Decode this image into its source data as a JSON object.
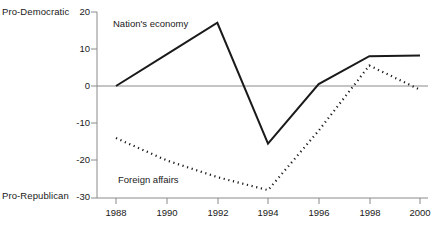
{
  "chart_data": {
    "type": "line",
    "title": "",
    "xlabel": "",
    "ylabel": "",
    "x": [
      1988,
      1990,
      1992,
      1994,
      1996,
      1998,
      2000
    ],
    "xtick_labels": [
      "1988",
      "1990",
      "1992",
      "1994",
      "1996",
      "1998",
      "2000"
    ],
    "ytick_labels": [
      "20",
      "10",
      "0",
      "-10",
      "-20",
      "-30"
    ],
    "ytick_values": [
      20,
      10,
      0,
      -10,
      -20,
      -30
    ],
    "ylim": [
      -30,
      20
    ],
    "xlim": [
      1988,
      2000
    ],
    "grid": false,
    "legend_position": "inline-annotations",
    "zero_line": true,
    "axis_top_label": "Pro-Democratic",
    "axis_bottom_label": "Pro-Republican",
    "series": [
      {
        "name": "Nation's economy",
        "style": "solid",
        "color": "#1a1a1a",
        "values": [
          0,
          8.5,
          17,
          -15.5,
          0.5,
          8,
          8.2
        ]
      },
      {
        "name": "Foreign affairs",
        "style": "dotted",
        "color": "#1a1a1a",
        "values": [
          -14,
          -20,
          -24.5,
          -28,
          -12,
          5.5,
          -1
        ]
      }
    ]
  },
  "annotations": {
    "nations_economy": "Nation's economy",
    "foreign_affairs": "Foreign affairs"
  },
  "colors": {
    "ink": "#1a1a1a",
    "axis": "#8a8a8a",
    "background": "#ffffff"
  }
}
